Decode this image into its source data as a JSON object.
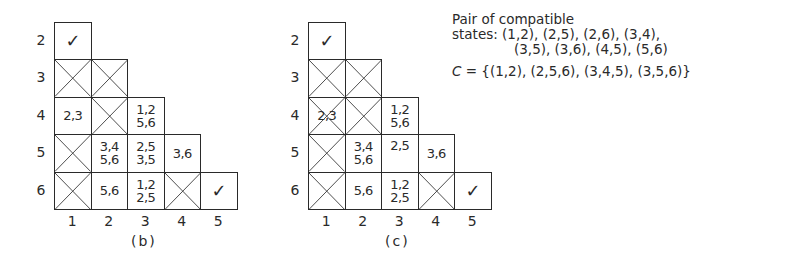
{
  "figures": [
    {
      "id": "b",
      "caption": "(b)",
      "row_labels": [
        "2",
        "3",
        "4",
        "5",
        "6"
      ],
      "col_labels": [
        "1",
        "2",
        "3",
        "4",
        "5"
      ],
      "cells": [
        {
          "row": 0,
          "col": 0,
          "type": "check",
          "lines": [
            "✓"
          ]
        },
        {
          "row": 1,
          "col": 0,
          "type": "cross",
          "lines": []
        },
        {
          "row": 1,
          "col": 1,
          "type": "cross",
          "lines": []
        },
        {
          "row": 2,
          "col": 0,
          "type": "text",
          "lines": [
            "2,3"
          ]
        },
        {
          "row": 2,
          "col": 1,
          "type": "cross",
          "lines": []
        },
        {
          "row": 2,
          "col": 2,
          "type": "text",
          "lines": [
            "1,2",
            "5,6"
          ]
        },
        {
          "row": 3,
          "col": 0,
          "type": "cross",
          "lines": []
        },
        {
          "row": 3,
          "col": 1,
          "type": "text",
          "lines": [
            "3,4",
            "5,6"
          ]
        },
        {
          "row": 3,
          "col": 2,
          "type": "text",
          "lines": [
            "2,5",
            "3,5"
          ]
        },
        {
          "row": 3,
          "col": 3,
          "type": "text",
          "lines": [
            "3,6"
          ]
        },
        {
          "row": 4,
          "col": 0,
          "type": "cross",
          "lines": []
        },
        {
          "row": 4,
          "col": 1,
          "type": "text",
          "lines": [
            "5,6"
          ]
        },
        {
          "row": 4,
          "col": 2,
          "type": "text",
          "lines": [
            "1,2",
            "2,5"
          ]
        },
        {
          "row": 4,
          "col": 3,
          "type": "cross",
          "lines": []
        },
        {
          "row": 4,
          "col": 4,
          "type": "check",
          "lines": [
            "✓"
          ]
        }
      ]
    },
    {
      "id": "c",
      "caption": "(c)",
      "row_labels": [
        "2",
        "3",
        "4",
        "5",
        "6"
      ],
      "col_labels": [
        "1",
        "2",
        "3",
        "4",
        "5"
      ],
      "cells": [
        {
          "row": 0,
          "col": 0,
          "type": "check",
          "lines": [
            "✓"
          ]
        },
        {
          "row": 1,
          "col": 0,
          "type": "cross",
          "lines": []
        },
        {
          "row": 1,
          "col": 1,
          "type": "cross",
          "lines": []
        },
        {
          "row": 2,
          "col": 0,
          "type": "crosstext",
          "lines": [
            "2,3"
          ]
        },
        {
          "row": 2,
          "col": 1,
          "type": "cross",
          "lines": []
        },
        {
          "row": 2,
          "col": 2,
          "type": "text",
          "lines": [
            "1,2",
            "5,6"
          ]
        },
        {
          "row": 3,
          "col": 0,
          "type": "cross",
          "lines": []
        },
        {
          "row": 3,
          "col": 1,
          "type": "text",
          "lines": [
            "3,4",
            "5,6"
          ]
        },
        {
          "row": 3,
          "col": 2,
          "type": "text",
          "lines": [
            "2,5"
          ],
          "align": "top"
        },
        {
          "row": 3,
          "col": 3,
          "type": "text",
          "lines": [
            "3,6"
          ]
        },
        {
          "row": 4,
          "col": 0,
          "type": "cross",
          "lines": []
        },
        {
          "row": 4,
          "col": 1,
          "type": "text",
          "lines": [
            "5,6"
          ]
        },
        {
          "row": 4,
          "col": 2,
          "type": "text",
          "lines": [
            "1,2",
            "2,5"
          ]
        },
        {
          "row": 4,
          "col": 3,
          "type": "cross",
          "lines": []
        },
        {
          "row": 4,
          "col": 4,
          "type": "check",
          "lines": [
            "✓"
          ]
        }
      ]
    }
  ],
  "notes": {
    "line1": "Pair of compatible",
    "line2": "states: (1,2), (2,5), (2,6), (3,4),",
    "line3": "(3,5), (3,6), (4,5), (5,6)",
    "cset_symbol": "C",
    "cset_value": " = {(1,2), (2,5,6), (3,4,5), (3,5,6)}"
  }
}
